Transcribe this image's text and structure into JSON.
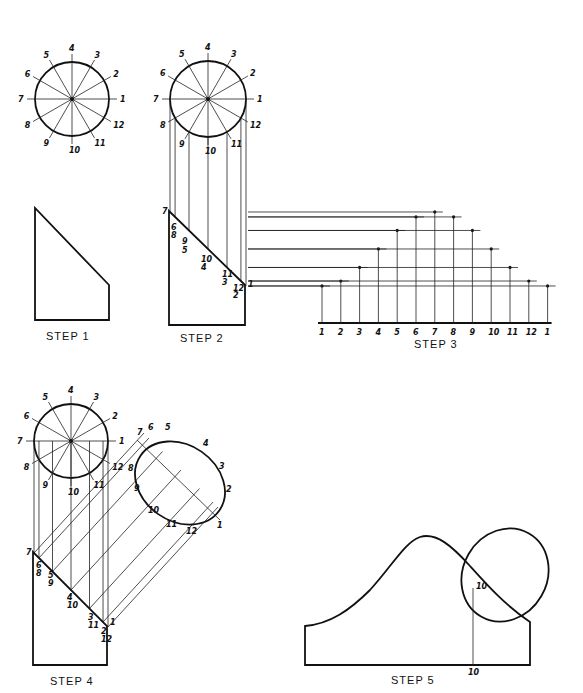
{
  "figure": {
    "background": "#ffffff",
    "ink": "#111111",
    "circle_labels": [
      "1",
      "2",
      "3",
      "4",
      "5",
      "6",
      "7",
      "8",
      "9",
      "10",
      "11",
      "12"
    ],
    "step1": {
      "label": "STEP 1"
    },
    "step2": {
      "label": "STEP 2",
      "edge_labels": [
        "7",
        "6",
        "8",
        "9",
        "5",
        "10",
        "4",
        "11",
        "3",
        "12",
        "2",
        "1"
      ]
    },
    "step3": {
      "label": "STEP 3",
      "baseline_labels": [
        "1",
        "2",
        "3",
        "4",
        "5",
        "6",
        "7",
        "8",
        "9",
        "10",
        "11",
        "12",
        "1"
      ]
    },
    "step4": {
      "label": "STEP 4",
      "ellipse_labels": [
        "7",
        "6",
        "5",
        "4",
        "3",
        "2",
        "1",
        "12",
        "11",
        "10",
        "9",
        "8"
      ],
      "edge_labels": [
        "7",
        "6",
        "8",
        "5",
        "9",
        "4",
        "10",
        "3",
        "11",
        "2",
        "12",
        "1"
      ]
    },
    "step5": {
      "label": "STEP 5",
      "point_label": "10",
      "base_label": "10"
    }
  }
}
